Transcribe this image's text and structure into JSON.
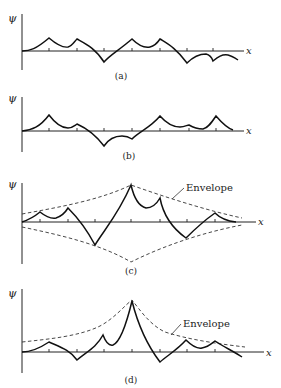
{
  "figure": {
    "panels": [
      {
        "id": "a",
        "caption": "(a)",
        "y_label": "ψ",
        "x_label": "x"
      },
      {
        "id": "b",
        "caption": "(b)",
        "y_label": "ψ",
        "x_label": "x"
      },
      {
        "id": "c",
        "caption": "(c)",
        "y_label": "ψ",
        "x_label": "x",
        "annotation": "Envelope"
      },
      {
        "id": "d",
        "caption": "(d)",
        "y_label": "ψ",
        "x_label": "x",
        "annotation": "Envelope"
      }
    ]
  }
}
